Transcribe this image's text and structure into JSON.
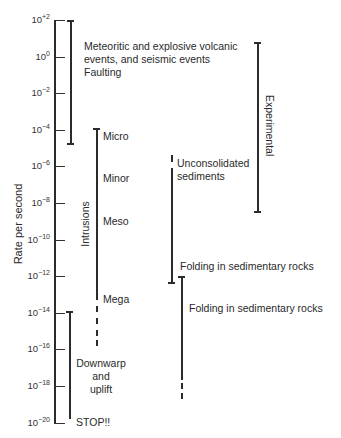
{
  "figure": {
    "y_axis_label": "Rate per second",
    "ticks": [
      {
        "base": "10",
        "exp": "+2",
        "y": 20
      },
      {
        "base": "10",
        "exp": "0",
        "y": 57
      },
      {
        "base": "10",
        "exp": "−2",
        "y": 93
      },
      {
        "base": "10",
        "exp": "−4",
        "y": 130
      },
      {
        "base": "10",
        "exp": "−6",
        "y": 166
      },
      {
        "base": "10",
        "exp": "−8",
        "y": 203
      },
      {
        "base": "10",
        "exp": "−10",
        "y": 240
      },
      {
        "base": "10",
        "exp": "−12",
        "y": 276
      },
      {
        "base": "10",
        "exp": "−14",
        "y": 313
      },
      {
        "base": "10",
        "exp": "−16",
        "y": 349
      },
      {
        "base": "10",
        "exp": "−18",
        "y": 386
      },
      {
        "base": "10",
        "exp": "−20",
        "y": 423
      }
    ],
    "ranges": {
      "meteoritic": {
        "label_line1": "Meteoritic and explosive volcanic",
        "label_line2": "events, and seismic events",
        "label_line3": "Faulting",
        "from": "10^+2",
        "to": "10^-3.3"
      },
      "intrusions": {
        "group_label": "Intrusions",
        "sub_labels": [
          "Micro",
          "Minor",
          "Meso",
          "Mega"
        ],
        "from": "10^-4",
        "to": "10^-16 (dashed below ~10^-14)"
      },
      "downwarp": {
        "label_line1": "Downwarp",
        "label_line2": "and",
        "label_line3": "uplift",
        "from": "10^-14",
        "to": "10^-20"
      },
      "stop": "STOP!!",
      "unconsolidated": {
        "label_line1": "Unconsolidated",
        "label_line2": "sediments",
        "from": "10^-5.5",
        "to": "10^-12"
      },
      "folding_upper": {
        "label": "Folding in sedimentary rocks"
      },
      "folding_lower": {
        "label": "Folding in sedimentary rocks",
        "from": "10^-12",
        "to": "10^-18 (dashed)"
      },
      "experimental": {
        "label": "Experimental",
        "from": "10^+1",
        "to": "10^-8.5"
      }
    }
  }
}
